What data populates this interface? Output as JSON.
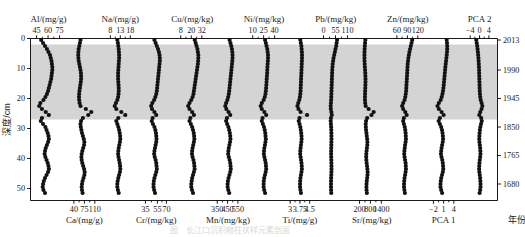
{
  "figure": {
    "caption": "图　长江口沉积物柱状样元素剖面",
    "left_axis": {
      "label": "深度/cm",
      "ticks": [
        0,
        10,
        20,
        30,
        40,
        50
      ],
      "range": [
        0,
        54
      ]
    },
    "right_axis": {
      "label": "年份",
      "ticks": [
        {
          "year": "2013",
          "depth": 0.5
        },
        {
          "year": "1990",
          "depth": 10.5
        },
        {
          "year": "1945",
          "depth": 20.0
        },
        {
          "year": "1850",
          "depth": 29.5
        },
        {
          "year": "1765",
          "depth": 39.0
        },
        {
          "year": "1680",
          "depth": 48.5
        }
      ]
    },
    "shaded_band": {
      "from_depth": 2.0,
      "to_depth": 27.0,
      "color": "#d4d4d4"
    },
    "marker": {
      "shape": "circle",
      "color": "#111111",
      "size": 2.1
    },
    "line_color": "#8a8a8a"
  },
  "chart_data": {
    "type": "scatter",
    "title": "图　长江口沉积物柱状样元素剖面",
    "xlabel": "",
    "ylabel": "深度/cm",
    "ylim": [
      0,
      54
    ],
    "grid": false,
    "legend": "none",
    "y_axis_name": "depth_cm",
    "secondary_y_axis": {
      "name": "年份",
      "ticks": [
        "2013",
        "1990",
        "1945",
        "1850",
        "1765",
        "1680"
      ]
    },
    "depth_cm": [
      0.5,
      1.5,
      2.5,
      3.5,
      4.5,
      5.5,
      6.5,
      7.5,
      8.5,
      9.5,
      10.5,
      11.5,
      12.5,
      13.5,
      14.5,
      15.5,
      16.5,
      17.5,
      18.5,
      19.5,
      20.5,
      21.5,
      22.5,
      23.5,
      24.5,
      25.5,
      26.5,
      27.5,
      28.5,
      29.5,
      30.5,
      31.5,
      32.5,
      33.5,
      34.5,
      35.5,
      36.5,
      37.5,
      38.5,
      39.5,
      40.5,
      41.5,
      42.5,
      43.5,
      44.5,
      45.5,
      46.5,
      47.5,
      48.5,
      49.5,
      50.5,
      51.5
    ],
    "panels": [
      {
        "key": "Al",
        "label": "Al/(mg/g)",
        "label_position": "top",
        "unit": "mg/g",
        "ticks": [
          45,
          60,
          75
        ],
        "xlim": [
          41,
          80
        ],
        "values": [
          51.0,
          53.5,
          56.0,
          58.5,
          60.5,
          62.5,
          63.5,
          64.5,
          65.0,
          65.5,
          65.5,
          65.0,
          64.5,
          64.0,
          63.0,
          62.0,
          61.0,
          60.0,
          58.5,
          56.5,
          54.0,
          50.0,
          48.5,
          52.0,
          57.0,
          61.0,
          52.0,
          50.5,
          53.5,
          56.5,
          58.0,
          59.5,
          60.5,
          61.0,
          60.0,
          58.5,
          57.0,
          56.0,
          55.5,
          56.5,
          58.0,
          59.5,
          60.5,
          61.0,
          60.0,
          58.0,
          56.0,
          54.5,
          53.5,
          53.0,
          54.0,
          56.0
        ]
      },
      {
        "key": "Ca",
        "label": "Ca/(mg/g)",
        "label_position": "bottom",
        "unit": "mg/g",
        "ticks": [
          40,
          75,
          110
        ],
        "xlim": [
          25,
          125
        ],
        "values": [
          62.0,
          60.0,
          58.0,
          56.0,
          55.0,
          54.5,
          55.0,
          56.0,
          58.0,
          60.0,
          62.0,
          63.5,
          64.0,
          64.0,
          63.0,
          61.5,
          60.0,
          58.5,
          57.5,
          57.0,
          57.5,
          59.0,
          62.0,
          80.0,
          98.0,
          88.0,
          70.0,
          64.0,
          62.0,
          63.0,
          65.0,
          67.0,
          70.0,
          73.0,
          75.0,
          74.0,
          71.0,
          68.0,
          66.0,
          65.0,
          66.0,
          68.0,
          71.0,
          74.0,
          76.0,
          75.0,
          72.0,
          69.0,
          67.0,
          66.0,
          67.0,
          69.0
        ]
      },
      {
        "key": "Na",
        "label": "Na/(mg/g)",
        "label_position": "top",
        "unit": "mg/g",
        "ticks": [
          8,
          13,
          18
        ],
        "xlim": [
          5.5,
          20.5
        ],
        "values": [
          11.5,
          11.8,
          12.0,
          12.2,
          12.3,
          12.4,
          12.4,
          12.3,
          12.2,
          12.1,
          12.0,
          11.9,
          11.9,
          11.9,
          12.0,
          12.1,
          12.2,
          12.2,
          12.1,
          11.9,
          11.5,
          10.8,
          10.2,
          11.0,
          13.5,
          15.5,
          12.0,
          11.0,
          11.5,
          12.0,
          12.4,
          12.7,
          12.9,
          13.0,
          12.8,
          12.5,
          12.2,
          12.0,
          11.9,
          12.1,
          12.4,
          12.7,
          12.9,
          13.0,
          12.8,
          12.4,
          12.0,
          11.7,
          11.5,
          11.5,
          11.8,
          12.2
        ]
      },
      {
        "key": "Cr",
        "label": "Cr/(mg/kg)",
        "label_position": "bottom",
        "unit": "mg/kg",
        "ticks": [
          35,
          55,
          70
        ],
        "xlim": [
          28,
          78
        ],
        "values": [
          50.0,
          52.0,
          54.0,
          56.0,
          57.5,
          58.5,
          59.0,
          59.0,
          58.5,
          58.0,
          57.5,
          57.0,
          56.5,
          56.0,
          55.5,
          55.0,
          54.5,
          54.0,
          53.0,
          51.5,
          49.5,
          46.5,
          44.5,
          46.0,
          50.0,
          53.0,
          47.0,
          45.5,
          47.5,
          50.0,
          51.5,
          52.5,
          53.0,
          53.5,
          53.0,
          52.0,
          51.0,
          50.0,
          49.5,
          50.5,
          52.0,
          53.0,
          53.5,
          54.0,
          53.0,
          51.5,
          50.0,
          49.0,
          48.5,
          48.5,
          49.5,
          51.0
        ]
      },
      {
        "key": "Cu",
        "label": "Cu/(mg/kg)",
        "label_position": "top",
        "unit": "mg/kg",
        "ticks": [
          8,
          20,
          32
        ],
        "xlim": [
          4,
          38
        ],
        "values": [
          24.0,
          25.0,
          26.0,
          27.0,
          27.5,
          28.0,
          28.0,
          27.8,
          27.5,
          27.0,
          26.5,
          26.0,
          25.5,
          25.0,
          24.5,
          24.0,
          23.5,
          23.0,
          22.5,
          21.5,
          20.0,
          18.0,
          16.5,
          18.0,
          21.0,
          23.0,
          19.0,
          18.0,
          19.5,
          21.0,
          22.0,
          22.8,
          23.2,
          23.5,
          23.0,
          22.2,
          21.5,
          21.0,
          20.8,
          21.5,
          22.5,
          23.2,
          23.5,
          23.8,
          23.0,
          22.0,
          21.0,
          20.5,
          20.0,
          20.0,
          20.8,
          22.0
        ]
      },
      {
        "key": "Mn",
        "label": "Mn/(mg/kg)",
        "label_position": "bottom",
        "unit": "mg/kg",
        "ticks": [
          350,
          450,
          550
        ],
        "xlim": [
          310,
          600
        ],
        "values": [
          470.0,
          478.0,
          486.0,
          492.0,
          496.0,
          498.0,
          498.0,
          496.0,
          493.0,
          490.0,
          487.0,
          484.0,
          481.0,
          478.0,
          475.0,
          472.0,
          469.0,
          466.0,
          462.0,
          456.0,
          448.0,
          436.0,
          428.0,
          438.0,
          460.0,
          476.0,
          444.0,
          436.0,
          446.0,
          458.0,
          466.0,
          472.0,
          476.0,
          478.0,
          474.0,
          468.0,
          462.0,
          458.0,
          456.0,
          462.0,
          470.0,
          476.0,
          479.0,
          481.0,
          476.0,
          468.0,
          460.0,
          454.0,
          451.0,
          451.0,
          457.0,
          466.0
        ]
      },
      {
        "key": "Ni",
        "label": "Ni/(mg/kg)",
        "label_position": "top",
        "unit": "mg/kg",
        "ticks": [
          10,
          25,
          40
        ],
        "xlim": [
          5,
          46
        ],
        "values": [
          27.0,
          28.0,
          29.0,
          30.0,
          30.5,
          31.0,
          31.0,
          30.8,
          30.5,
          30.2,
          30.0,
          29.8,
          29.5,
          29.2,
          29.0,
          28.7,
          28.4,
          28.0,
          27.5,
          26.5,
          25.0,
          22.5,
          21.0,
          22.5,
          26.0,
          28.5,
          23.5,
          22.5,
          24.0,
          25.5,
          26.5,
          27.2,
          27.6,
          28.0,
          27.5,
          26.8,
          26.0,
          25.5,
          25.3,
          26.0,
          27.0,
          27.8,
          28.2,
          28.5,
          27.8,
          26.8,
          25.8,
          25.2,
          25.0,
          25.0,
          25.8,
          27.0
        ]
      },
      {
        "key": "Ti",
        "label": "Ti/(mg/g)",
        "label_position": "bottom",
        "unit": "mg/g",
        "ticks": [
          3,
          3.75,
          4.5
        ],
        "xlim": [
          2.6,
          4.9
        ],
        "values": [
          3.78,
          3.82,
          3.86,
          3.88,
          3.9,
          3.91,
          3.91,
          3.9,
          3.89,
          3.88,
          3.87,
          3.86,
          3.85,
          3.84,
          3.83,
          3.82,
          3.81,
          3.8,
          3.78,
          3.75,
          3.7,
          3.62,
          3.56,
          3.64,
          3.8,
          4.3,
          3.72,
          3.66,
          3.72,
          3.78,
          3.82,
          3.85,
          3.87,
          3.88,
          3.86,
          3.83,
          3.8,
          3.78,
          3.77,
          3.8,
          3.84,
          3.87,
          3.89,
          3.9,
          3.87,
          3.83,
          3.79,
          3.77,
          3.76,
          3.76,
          3.79,
          3.83
        ]
      },
      {
        "key": "Pb",
        "label": "Pb/(mg/kg)",
        "label_position": "top",
        "unit": "mg/kg",
        "ticks": [
          0,
          55,
          110
        ],
        "xlim": [
          -12,
          125
        ],
        "values": [
          62.0,
          60.0,
          58.0,
          55.0,
          52.0,
          49.0,
          46.0,
          44.0,
          42.0,
          41.0,
          40.0,
          39.5,
          39.0,
          38.5,
          38.0,
          37.5,
          37.0,
          36.5,
          36.0,
          35.5,
          35.0,
          34.0,
          33.0,
          33.5,
          36.0,
          38.0,
          34.0,
          33.0,
          34.0,
          35.0,
          35.5,
          36.0,
          36.2,
          36.4,
          36.2,
          35.8,
          35.4,
          35.0,
          34.8,
          35.2,
          35.8,
          36.2,
          36.4,
          36.6,
          36.2,
          35.6,
          35.0,
          34.6,
          34.4,
          34.4,
          34.8,
          35.4
        ]
      },
      {
        "key": "Sr",
        "label": "Sr/(mg/kg)",
        "label_position": "bottom",
        "unit": "mg/kg",
        "ticks": [
          200,
          800,
          1400
        ],
        "xlim": [
          50,
          1700
        ],
        "values": [
          520.0,
          505.0,
          492.0,
          482.0,
          476.0,
          472.0,
          472.0,
          476.0,
          484.0,
          494.0,
          506.0,
          516.0,
          524.0,
          528.0,
          528.0,
          524.0,
          518.0,
          510.0,
          504.0,
          500.0,
          502.0,
          512.0,
          540.0,
          700.0,
          980.0,
          860.0,
          620.0,
          560.0,
          540.0,
          548.0,
          562.0,
          580.0,
          600.0,
          620.0,
          634.0,
          628.0,
          608.0,
          588.0,
          574.0,
          568.0,
          576.0,
          592.0,
          612.0,
          632.0,
          646.0,
          640.0,
          620.0,
          600.0,
          586.0,
          580.0,
          588.0,
          604.0
        ]
      },
      {
        "key": "Zn",
        "label": "Zn/(mg/kg)",
        "label_position": "top",
        "unit": "mg/kg",
        "ticks": [
          60,
          90,
          120
        ],
        "xlim": [
          48,
          134
        ],
        "values": [
          104.0,
          102.0,
          100.0,
          98.0,
          96.0,
          94.5,
          93.0,
          92.0,
          91.0,
          90.5,
          90.0,
          89.5,
          89.0,
          88.5,
          88.0,
          87.5,
          87.0,
          86.5,
          85.5,
          84.0,
          82.0,
          78.0,
          75.0,
          78.0,
          84.0,
          88.0,
          80.0,
          78.0,
          80.0,
          82.5,
          84.0,
          85.0,
          85.5,
          86.0,
          85.0,
          83.5,
          82.5,
          81.5,
          81.0,
          82.0,
          83.5,
          85.0,
          85.5,
          86.0,
          85.0,
          83.5,
          82.0,
          81.0,
          80.5,
          80.5,
          81.5,
          83.0
        ]
      },
      {
        "key": "PCA1",
        "label": "PCA 1",
        "label_position": "bottom",
        "unit": "",
        "ticks": [
          -2,
          1,
          4
        ],
        "xlim": [
          -3.4,
          5.4
        ],
        "values": [
          1.9,
          2.0,
          2.05,
          2.05,
          2.0,
          1.92,
          1.82,
          1.72,
          1.62,
          1.52,
          1.44,
          1.36,
          1.28,
          1.2,
          1.12,
          1.04,
          0.94,
          0.82,
          0.66,
          0.44,
          0.14,
          -0.4,
          -0.8,
          -0.4,
          0.4,
          1.0,
          -0.1,
          -0.45,
          -0.1,
          0.28,
          0.52,
          0.68,
          0.78,
          0.84,
          0.74,
          0.56,
          0.4,
          0.28,
          0.22,
          0.38,
          0.6,
          0.76,
          0.84,
          0.9,
          0.76,
          0.52,
          0.3,
          0.16,
          0.08,
          0.08,
          0.28,
          0.56
        ]
      },
      {
        "key": "PCA2",
        "label": "PCA 2",
        "label_position": "top",
        "unit": "",
        "ticks": [
          -4,
          0,
          4
        ],
        "xlim": [
          -6.4,
          6.4
        ],
        "values": [
          -1.4,
          -1.2,
          -1.0,
          -0.84,
          -0.7,
          -0.58,
          -0.48,
          -0.4,
          -0.32,
          -0.26,
          -0.2,
          -0.16,
          -0.12,
          -0.08,
          -0.04,
          0.0,
          0.04,
          0.1,
          0.18,
          0.3,
          0.5,
          0.88,
          1.2,
          0.86,
          0.3,
          -0.1,
          0.7,
          0.94,
          0.64,
          0.34,
          0.16,
          0.02,
          -0.06,
          -0.12,
          -0.04,
          0.12,
          0.26,
          0.36,
          0.4,
          0.28,
          0.1,
          -0.04,
          -0.12,
          -0.18,
          -0.08,
          0.1,
          0.26,
          0.36,
          0.42,
          0.42,
          0.26,
          0.04
        ]
      }
    ]
  }
}
